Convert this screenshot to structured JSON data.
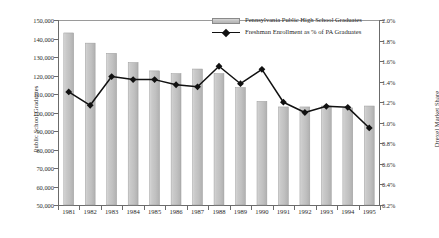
{
  "chart_data": {
    "type": "bar",
    "title": "",
    "subtitle": "",
    "xlabel": "",
    "ylabel": "Public School Graduates",
    "y2label": "Drexel Market Share",
    "grid": false,
    "legend_position": "top-right-inside",
    "categories": [
      "1981",
      "1982",
      "1983",
      "1984",
      "1985",
      "1986",
      "1987",
      "1988",
      "1989",
      "1990",
      "1991",
      "1992",
      "1993",
      "1994",
      "1995"
    ],
    "ylim": [
      50000,
      150000
    ],
    "y2lim": [
      0.2,
      2.0
    ],
    "ytick_labels": [
      "150,000",
      "140,000",
      "130,000",
      "120,000",
      "110,000",
      "100,000",
      "90,000",
      "80,000",
      "70,000",
      "60,000",
      "50,000"
    ],
    "ytick_values": [
      150000,
      140000,
      130000,
      120000,
      110000,
      100000,
      90000,
      80000,
      70000,
      60000,
      50000
    ],
    "y2tick_labels": [
      "2.0%",
      "1.8%",
      "1.6%",
      "1.4%",
      "1.2%",
      "1.0%",
      "0.8%",
      "0.6%",
      "0.4%",
      "0.2%"
    ],
    "y2tick_values": [
      2.0,
      1.8,
      1.6,
      1.4,
      1.2,
      1.0,
      0.8,
      0.6,
      0.4,
      0.2
    ],
    "series": [
      {
        "name": "Pennsylvania Public High School Graduates",
        "type": "bar",
        "axis": "left",
        "color": "#c3c3c3",
        "values": [
          143000,
          137500,
          132000,
          127000,
          122500,
          121000,
          123500,
          121000,
          113500,
          106000,
          103000,
          103000,
          103500,
          102500,
          103500
        ]
      },
      {
        "name": "Freshman Enrollment as % of PA Graduates",
        "type": "line",
        "axis": "right",
        "color": "#111111",
        "marker": "diamond",
        "values": [
          1.3,
          1.17,
          1.45,
          1.42,
          1.42,
          1.37,
          1.35,
          1.55,
          1.38,
          1.52,
          1.2,
          1.1,
          1.16,
          1.15,
          0.95
        ]
      }
    ]
  },
  "legend": {
    "items": [
      {
        "label": "Pennsylvania Public High School Graduates",
        "marker": "bar-swatch"
      },
      {
        "label": "Freshman Enrollment as % of PA Graduates",
        "marker": "line-diamond-swatch"
      }
    ]
  },
  "axes": {
    "left_title": "Public School Graduates",
    "right_title": "Drexel Market Share"
  }
}
